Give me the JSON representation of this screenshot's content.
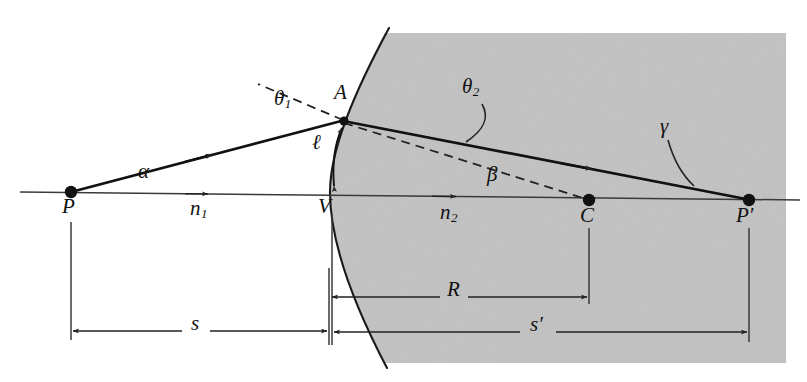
{
  "figure": {
    "type": "optics-ray-diagram",
    "colors": {
      "ink": "#111111",
      "shade": "#cccccc",
      "background": "#ffffff",
      "thin_line": "#3a3a3a"
    },
    "media": {
      "left_label": "n",
      "left_sub": "1",
      "right_label": "n",
      "right_sub": "2"
    },
    "points": [
      {
        "name": "P",
        "label": "P",
        "x": 71,
        "y": 192,
        "lx": 62,
        "ly": 203
      },
      {
        "name": "A",
        "label": "A",
        "x": 343,
        "y": 120,
        "lx": 334,
        "ly": 84
      },
      {
        "name": "V",
        "label": "V",
        "x": 330,
        "y": 192,
        "lx": 319,
        "ly": 203
      },
      {
        "name": "C",
        "label": "C",
        "x": 589,
        "y": 200,
        "lx": 580,
        "ly": 211
      },
      {
        "name": "P-prime",
        "label": "P′",
        "x": 749,
        "y": 200,
        "lx": 737,
        "ly": 211
      }
    ],
    "angles": [
      {
        "name": "alpha",
        "label": "α",
        "lx": 140,
        "ly": 168
      },
      {
        "name": "theta1",
        "label": "θ",
        "sub": "1",
        "lx": 277,
        "ly": 96
      },
      {
        "name": "theta2",
        "label": "θ",
        "sub": "2",
        "lx": 464,
        "ly": 84
      },
      {
        "name": "beta",
        "label": "β",
        "lx": 489,
        "ly": 172
      },
      {
        "name": "gamma",
        "label": "γ",
        "lx": 662,
        "ly": 124
      }
    ],
    "dimensions": [
      {
        "name": "arc-length-l",
        "label": "ℓ",
        "lx": 315,
        "ly": 140
      },
      {
        "name": "radius-R",
        "label": "R",
        "lx": 452,
        "ly": 286,
        "from_x": 330,
        "to_x": 589,
        "y": 297
      },
      {
        "name": "object-distance-s",
        "label": "s",
        "lx": 195,
        "ly": 320,
        "from_x": 71,
        "to_x": 328,
        "y": 331
      },
      {
        "name": "image-distance-sp",
        "label": "s′",
        "lx": 535,
        "ly": 321,
        "from_x": 333,
        "to_x": 749,
        "y": 332
      }
    ],
    "rays": {
      "incident": {
        "from": "P",
        "to": "A"
      },
      "refracted": {
        "from": "A",
        "to": "P-prime"
      },
      "axis": {
        "from_x": 20,
        "to_x": 800,
        "y": 192
      },
      "normal_dashed": {
        "from": "A",
        "to_x": 258,
        "to_y": 84
      },
      "radius_dashed": {
        "from": "A",
        "to": "C"
      }
    }
  }
}
